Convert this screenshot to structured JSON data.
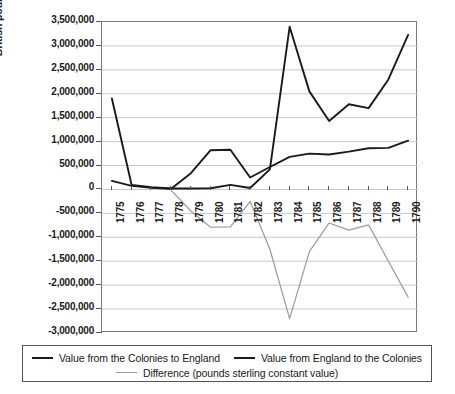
{
  "chart_data": {
    "type": "line",
    "title": "",
    "xlabel": "",
    "ylabel": "British pounds sterling",
    "x": [
      1775,
      1776,
      1777,
      1778,
      1779,
      1780,
      1781,
      1782,
      1783,
      1784,
      1785,
      1786,
      1787,
      1788,
      1789,
      1790
    ],
    "categories": [
      "1775",
      "1776",
      "1777",
      "1778",
      "1779",
      "1780",
      "1781",
      "1782",
      "1783",
      "1784",
      "1785",
      "1786",
      "1787",
      "1788",
      "1789",
      "1790"
    ],
    "ylim": [
      -3000000,
      3500000
    ],
    "ytick_step": 500000,
    "ytick_labels": [
      "3,500,000",
      "3,000,000",
      "2,500,000",
      "2,000,000",
      "1,500,000",
      "1,000,000",
      "500,000",
      "0",
      "-500,000",
      "-1,000,000",
      "-1,500,000",
      "-2,000,000",
      "-2,500,000",
      "-3,000,000"
    ],
    "ytick_values": [
      3500000,
      3000000,
      2500000,
      2000000,
      1500000,
      1000000,
      500000,
      0,
      -500000,
      -1000000,
      -1500000,
      -2000000,
      -2500000,
      -3000000
    ],
    "grid": true,
    "legend_position": "bottom",
    "series": [
      {
        "name": "Value from the Colonies to England",
        "color": "#1a1a1a",
        "width": 1.9,
        "values": [
          1900000,
          95000,
          45000,
          20000,
          20000,
          25000,
          95000,
          30000,
          420000,
          3400000,
          2050000,
          1430000,
          1780000,
          1700000,
          2300000,
          3230000
        ]
      },
      {
        "name": "Value from England to the Colonies",
        "color": "#1a1a1a",
        "width": 1.9,
        "values": [
          180000,
          75000,
          35000,
          15000,
          340000,
          820000,
          830000,
          250000,
          470000,
          680000,
          750000,
          730000,
          790000,
          860000,
          870000,
          1020000
        ]
      },
      {
        "name": "Difference (pounds sterling constant value)",
        "color": "#9a9a9a",
        "width": 1.2,
        "values": [
          null,
          null,
          null,
          -20000,
          -450000,
          -790000,
          -780000,
          -250000,
          -1250000,
          -2700000,
          -1300000,
          -700000,
          -850000,
          -740000,
          -1500000,
          -2250000
        ]
      }
    ]
  },
  "legend": {
    "entries": [
      {
        "label": "Value from the Colonies to England",
        "style": "dark"
      },
      {
        "label": "Value from England to the Colonies",
        "style": "dark"
      },
      {
        "label": "Difference (pounds sterling constant value)",
        "style": "gray"
      }
    ]
  }
}
